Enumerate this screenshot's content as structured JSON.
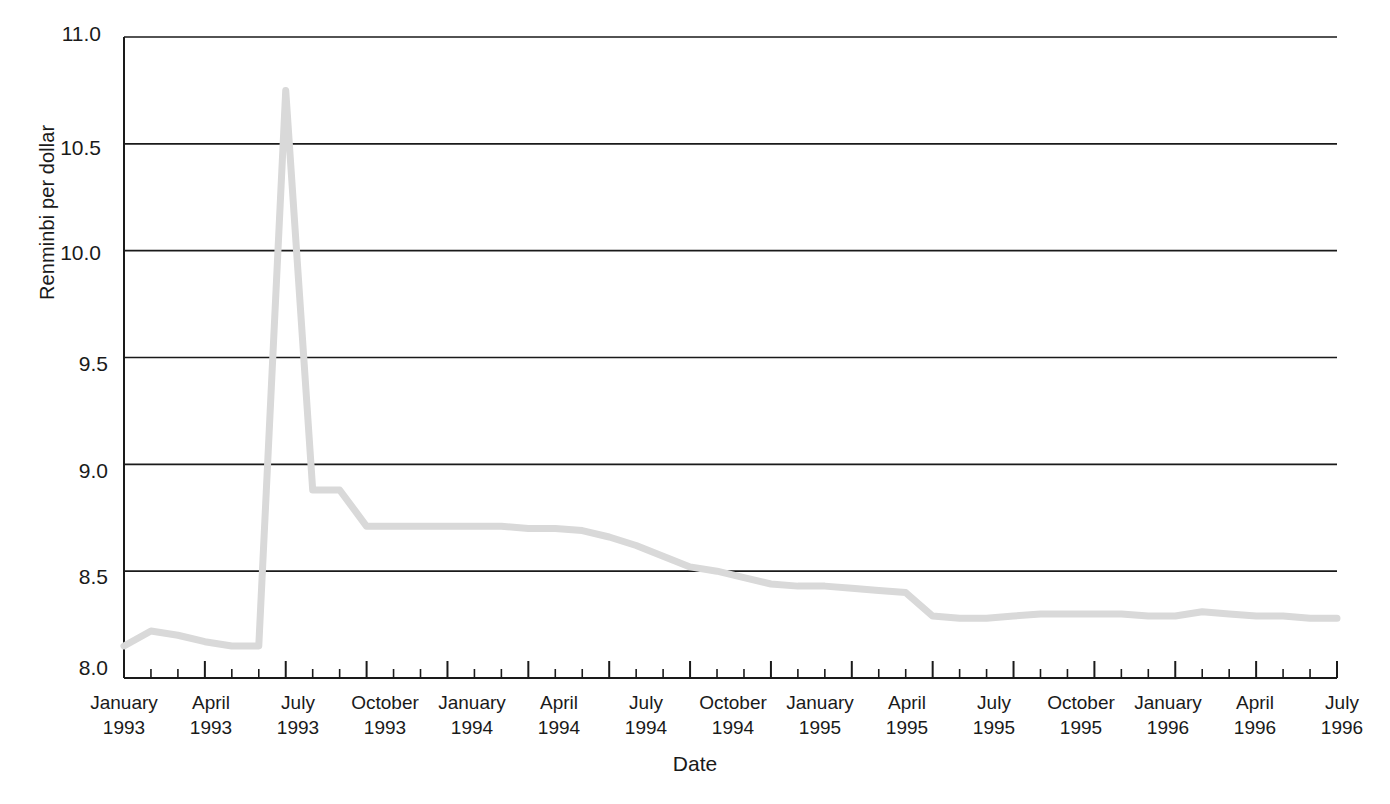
{
  "chart_data": {
    "type": "line",
    "title": "",
    "xlabel": "Date",
    "ylabel": "Renminbi per dollar",
    "ylim": [
      8.0,
      11.0
    ],
    "y_ticks": [
      "8.0",
      "8.5",
      "9.0",
      "9.5",
      "10.0",
      "10.5",
      "11.0"
    ],
    "y_tick_values": [
      8.0,
      8.5,
      9.0,
      9.5,
      10.0,
      10.5,
      11.0
    ],
    "grid": "horizontal",
    "legend": "none",
    "line_color": "#d9d9d9",
    "axis_color": "#1a1a1a",
    "x_tick_labels": [
      {
        "month": "January",
        "year": "1993"
      },
      {
        "month": "April",
        "year": "1993"
      },
      {
        "month": "July",
        "year": "1993"
      },
      {
        "month": "October",
        "year": "1993"
      },
      {
        "month": "January",
        "year": "1994"
      },
      {
        "month": "April",
        "year": "1994"
      },
      {
        "month": "July",
        "year": "1994"
      },
      {
        "month": "October",
        "year": "1994"
      },
      {
        "month": "January",
        "year": "1995"
      },
      {
        "month": "April",
        "year": "1995"
      },
      {
        "month": "July",
        "year": "1995"
      },
      {
        "month": "October",
        "year": "1995"
      },
      {
        "month": "January",
        "year": "1996"
      },
      {
        "month": "April",
        "year": "1996"
      },
      {
        "month": "July",
        "year": "1996"
      }
    ],
    "x": [
      "January 1993",
      "February 1993",
      "March 1993",
      "April 1993",
      "May 1993",
      "June 1993",
      "July 1993",
      "August 1993",
      "September 1993",
      "October 1993",
      "November 1993",
      "December 1993",
      "January 1994",
      "February 1994",
      "March 1994",
      "April 1994",
      "May 1994",
      "June 1994",
      "July 1994",
      "August 1994",
      "September 1994",
      "October 1994",
      "November 1994",
      "December 1994",
      "January 1995",
      "February 1995",
      "March 1995",
      "April 1995",
      "May 1995",
      "June 1995",
      "July 1995",
      "August 1995",
      "September 1995",
      "October 1995",
      "November 1995",
      "December 1995",
      "January 1996",
      "February 1996",
      "March 1996",
      "April 1996",
      "May 1996",
      "June 1996",
      "July 1996",
      "August 1996",
      "September 1996",
      "October 1996"
    ],
    "values": [
      8.15,
      8.22,
      8.2,
      8.17,
      8.15,
      8.15,
      10.75,
      8.88,
      8.88,
      8.71,
      8.71,
      8.71,
      8.71,
      8.71,
      8.71,
      8.7,
      8.7,
      8.69,
      8.66,
      8.62,
      8.57,
      8.52,
      8.5,
      8.47,
      8.44,
      8.43,
      8.43,
      8.42,
      8.41,
      8.4,
      8.29,
      8.28,
      8.28,
      8.29,
      8.3,
      8.3,
      8.3,
      8.3,
      8.29,
      8.29,
      8.31,
      8.3,
      8.29,
      8.29,
      8.28,
      8.28
    ],
    "annotations": {
      "peak_value": 10.75,
      "peak_date": "June 1993",
      "start_value": 8.15,
      "end_value": 8.28
    }
  }
}
